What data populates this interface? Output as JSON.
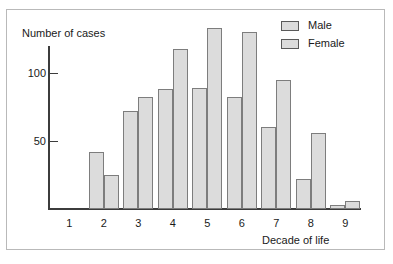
{
  "chart_data": {
    "type": "bar",
    "title": "",
    "xlabel": "Decade of life",
    "ylabel": "Number of cases",
    "categories": [
      "1",
      "2",
      "3",
      "4",
      "5",
      "6",
      "7",
      "8",
      "9"
    ],
    "series": [
      {
        "name": "Male",
        "values": [
          0,
          42,
          72,
          88,
          89,
          82,
          60,
          22,
          3
        ]
      },
      {
        "name": "Female",
        "values": [
          0,
          25,
          82,
          118,
          133,
          130,
          95,
          56,
          6
        ]
      }
    ],
    "ytick_labels": [
      "100",
      "50"
    ],
    "ytick_values": [
      100,
      50
    ],
    "ylim": [
      0,
      140
    ],
    "grid": false,
    "legend_position": "top-right",
    "colors": {
      "bar_fill": "#dcdcdc",
      "bar_border": "#7d7d7d",
      "axis": "#3c3c3c",
      "text": "#1a1a1a",
      "frame": "#b9b9b9",
      "background": "#ffffff"
    }
  },
  "legend": {
    "entries": [
      {
        "label": "Male"
      },
      {
        "label": "Female"
      }
    ]
  }
}
